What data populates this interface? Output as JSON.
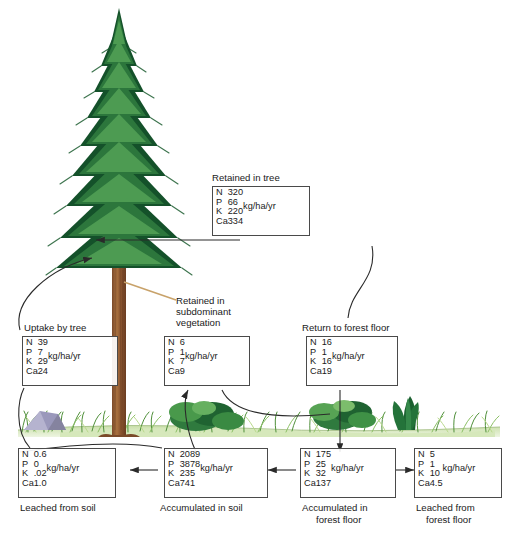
{
  "figure": {
    "unit_label": "kg/ha/yr",
    "elements": [
      "N",
      "P",
      "K",
      "Ca"
    ],
    "ink_color": "#4a4a4a",
    "text_color": "#1a1a1a"
  },
  "boxes": {
    "retained_in_tree": {
      "caption": "Retained in tree",
      "unit": "kg/ha/yr",
      "rows": [
        {
          "element": "N",
          "value": "320"
        },
        {
          "element": "P",
          "value": "66"
        },
        {
          "element": "K",
          "value": "220"
        },
        {
          "element": "Ca",
          "value": "334"
        }
      ]
    },
    "uptake_by_tree": {
      "caption": "Uptake by tree",
      "unit": "kg/ha/yr",
      "rows": [
        {
          "element": "N",
          "value": "39"
        },
        {
          "element": "P",
          "value": "7"
        },
        {
          "element": "K",
          "value": "29"
        },
        {
          "element": "Ca",
          "value": "24"
        }
      ]
    },
    "retained_in_subdominant_vegetation": {
      "caption_line1": "Retained in",
      "caption_line2": "subdominant",
      "caption_line3": "vegetation",
      "unit": "kg/ha/yr",
      "rows": [
        {
          "element": "N",
          "value": "6"
        },
        {
          "element": "P",
          "value": "1"
        },
        {
          "element": "K",
          "value": "7"
        },
        {
          "element": "Ca",
          "value": "9"
        }
      ]
    },
    "return_to_forest_floor": {
      "caption": "Return to forest floor",
      "unit": "kg/ha/yr",
      "rows": [
        {
          "element": "N",
          "value": "16"
        },
        {
          "element": "P",
          "value": "1"
        },
        {
          "element": "K",
          "value": "16"
        },
        {
          "element": "Ca",
          "value": "19"
        }
      ]
    },
    "leached_from_soil": {
      "caption": "Leached from soil",
      "unit": "kg/ha/yr",
      "rows": [
        {
          "element": "N",
          "value": "0.6"
        },
        {
          "element": "P",
          "value": "0"
        },
        {
          "element": "K",
          "value": ".02"
        },
        {
          "element": "Ca",
          "value": "1.0"
        }
      ]
    },
    "accumulated_in_soil": {
      "caption": "Accumulated in soil",
      "unit": "kg/ha/yr",
      "rows": [
        {
          "element": "N",
          "value": "2089"
        },
        {
          "element": "P",
          "value": "3878"
        },
        {
          "element": "K",
          "value": "235"
        },
        {
          "element": "Ca",
          "value": "741"
        }
      ]
    },
    "accumulated_in_forest_floor": {
      "caption_line1": "Accumulated in",
      "caption_line2": "forest floor",
      "unit": "kg/ha/yr",
      "rows": [
        {
          "element": "N",
          "value": "175"
        },
        {
          "element": "P",
          "value": "25"
        },
        {
          "element": "K",
          "value": "32"
        },
        {
          "element": "Ca",
          "value": "137"
        }
      ]
    },
    "leached_from_forest_floor": {
      "caption_line1": "Leached from",
      "caption_line2": "forest floor",
      "unit": "kg/ha/yr",
      "rows": [
        {
          "element": "N",
          "value": "5"
        },
        {
          "element": "P",
          "value": "1"
        },
        {
          "element": "K",
          "value": "10"
        },
        {
          "element": "Ca",
          "value": "4.5"
        }
      ]
    }
  }
}
